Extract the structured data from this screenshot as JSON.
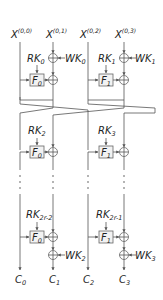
{
  "inputs": [
    {
      "base": "X",
      "sup": "(0,0)"
    },
    {
      "base": "X",
      "sup": "(0,1)"
    },
    {
      "base": "X",
      "sup": "(0,2)"
    },
    {
      "base": "X",
      "sup": "(0,3)"
    }
  ],
  "whitening_in": [
    {
      "base": "WK",
      "sub": "0"
    },
    {
      "base": "WK",
      "sub": "1"
    }
  ],
  "round1": {
    "keys": [
      {
        "base": "RK",
        "sub": "0"
      },
      {
        "base": "RK",
        "sub": "1"
      }
    ],
    "functions": [
      {
        "base": "F",
        "sub": "0"
      },
      {
        "base": "F",
        "sub": "1"
      }
    ]
  },
  "round2": {
    "keys": [
      {
        "base": "RK",
        "sub": "2"
      },
      {
        "base": "RK",
        "sub": "3"
      }
    ],
    "functions": [
      {
        "base": "F",
        "sub": "0"
      },
      {
        "base": "F",
        "sub": "1"
      }
    ]
  },
  "round_last": {
    "keys": [
      {
        "base": "RK",
        "sub": "2r-2"
      },
      {
        "base": "RK",
        "sub": "2r-1"
      }
    ],
    "functions": [
      {
        "base": "F",
        "sub": "0"
      },
      {
        "base": "F",
        "sub": "1"
      }
    ]
  },
  "whitening_out": [
    {
      "base": "WK",
      "sub": "2"
    },
    {
      "base": "WK",
      "sub": "3"
    }
  ],
  "outputs": [
    {
      "base": "C",
      "sub": "0"
    },
    {
      "base": "C",
      "sub": "1"
    },
    {
      "base": "C",
      "sub": "2"
    },
    {
      "base": "C",
      "sub": "3"
    }
  ]
}
